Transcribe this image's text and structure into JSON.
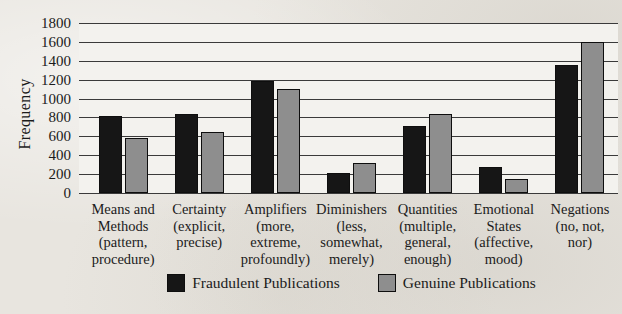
{
  "chart_data": {
    "type": "bar",
    "title": "",
    "xlabel": "",
    "ylabel": "Frequency",
    "ymax": 1800,
    "ystep": 200,
    "ylim": [
      0,
      1800
    ],
    "grid": true,
    "legend_position": "bottom",
    "yticks": [
      "1800",
      "1600",
      "1400",
      "1200",
      "1000",
      "800",
      "600",
      "400",
      "200",
      "0"
    ],
    "categories": [
      [
        "Means and",
        "Methods",
        "(pattern,",
        "procedure)"
      ],
      [
        "Certainty",
        "(explicit,",
        "precise)"
      ],
      [
        "Amplifiers",
        "(more,",
        "extreme,",
        "profoundly)"
      ],
      [
        "Diminishers",
        "(less,",
        "somewhat,",
        "merely)"
      ],
      [
        "Quantities",
        "(multiple,",
        "general,",
        "enough)"
      ],
      [
        "Emotional",
        "States",
        "(affective,",
        "mood)"
      ],
      [
        "Negations",
        "(no, not,",
        "nor)"
      ]
    ],
    "series": [
      {
        "name": "Fraudulent Publications",
        "color": "#161616",
        "values": [
          820,
          840,
          1190,
          215,
          710,
          280,
          1350
        ]
      },
      {
        "name": "Genuine Publications",
        "color": "#8e8e8e",
        "values": [
          580,
          645,
          1100,
          315,
          835,
          145,
          1600
        ]
      }
    ],
    "colors": {
      "gridline": "#3a3a3a",
      "plot_bg": "#f3f2ee",
      "page_bg": "#e8e5df",
      "bar_border": "#0e0e0e"
    }
  }
}
